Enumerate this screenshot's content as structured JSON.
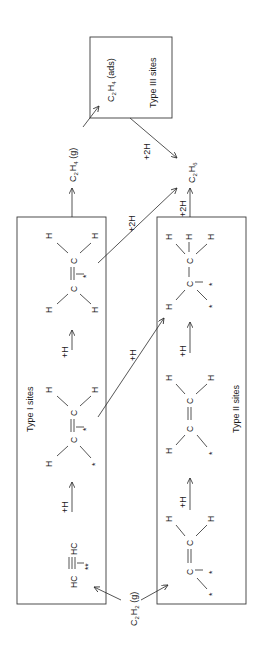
{
  "diagram": {
    "orientation": "rotated-90-ccw",
    "nodes": {
      "c2h2_gas": {
        "main": "C",
        "sub1": "2",
        "mid": "H",
        "sub2": "2",
        "suffix": " (g)"
      },
      "c2h4_gas": {
        "main": "C",
        "sub1": "2",
        "mid": "H",
        "sub2": "4",
        "suffix": " (g)"
      },
      "c2h4_ads": {
        "main": "C",
        "sub1": "2",
        "mid": "H",
        "sub2": "4",
        "suffix": " (ads)"
      },
      "c2h6": {
        "main": "C",
        "sub1": "2",
        "mid": "H",
        "sub2": "6"
      }
    },
    "boxes": {
      "type1": {
        "label": "Type I sites"
      },
      "type2": {
        "label": "Type II sites"
      },
      "type3": {
        "label": "Type III sites"
      }
    },
    "arrow_labels": {
      "plus_h": "+H",
      "plus_2h": "+2H"
    },
    "atoms": {
      "H": "H",
      "C": "C",
      "HC": "HC",
      "star": "*",
      "double_star": "**"
    }
  }
}
